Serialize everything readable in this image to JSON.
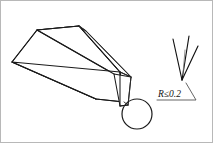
{
  "figure": {
    "annotations": {
      "radius_note": "R≤0.2",
      "radius_symbol": "R",
      "radius_relation": "≤",
      "radius_value": "0.2"
    },
    "parts": {
      "body_name": "elongated-wedge-body",
      "tip_name": "chisel-tip",
      "callout_name": "magnification-circle",
      "detail_name": "tip-detail-view"
    },
    "colors": {
      "line": "#1a1a1a",
      "detail_line": "#111111",
      "faint_line": "#777777",
      "leader": "#4a4a4a",
      "frame": "#b8b8b8",
      "background": "#ffffff"
    },
    "geometry": {
      "body_top_face": "11,62 36,30 78,26 118,71",
      "body_front_face": "11,62 118,71 124,101 96,99",
      "body_side_face": "78,26 85,30 131,76 124,101 118,71",
      "tip_polygon": "112,74 131,76 128,104 119,105",
      "circle_center_x": 137,
      "circle_center_y": 114,
      "circle_radius": 15,
      "detail_apex_x": 182,
      "detail_apex_y": 80,
      "detail_line_1": "173,39 182,80",
      "detail_line_2": "188,36 182,80",
      "detail_line_3": "197,45 182,80",
      "leader_path": "157,99 196,99 186,82"
    }
  }
}
